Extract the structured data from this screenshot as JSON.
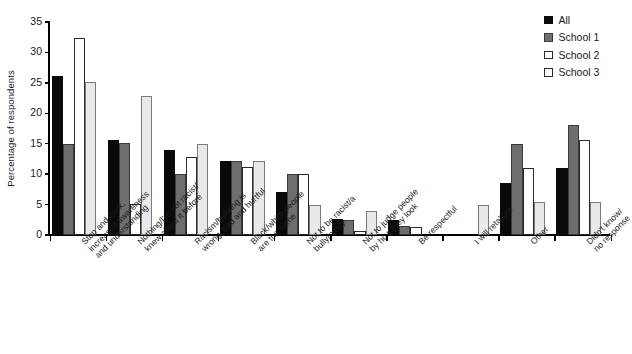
{
  "chart_data": {
    "type": "bar",
    "title": "",
    "xlabel": "",
    "ylabel": "Percentage of respondents",
    "ylim": [
      0,
      35
    ],
    "ytick_step": 5,
    "yticks": [
      0,
      5,
      10,
      15,
      20,
      25,
      30,
      35
    ],
    "grid": false,
    "legend_position": "top-right",
    "categories": [
      "Stop and think,\nincreased awareness\nand understanding",
      "Nothing/I'm not racist/\nknew about it before",
      "Racism/bullying is\nwrong, bad and hurtful",
      "Black/white people\nare the same",
      "Not to be racist/a\nbully/nasty",
      "Not to judge people\nby how they look",
      "Be respectful",
      "I will retaliate",
      "Other",
      "Didn't know/\nno response"
    ],
    "series": [
      {
        "name": "All",
        "color": "#0a0a0a",
        "values": [
          26.2,
          15.6,
          13.9,
          12.2,
          7.0,
          2.6,
          2.5,
          0.0,
          8.6,
          11.0
        ]
      },
      {
        "name": "School 1",
        "color": "#6e6e6e",
        "values": [
          15.0,
          15.1,
          10.1,
          12.2,
          10.0,
          2.5,
          1.4,
          0.0,
          14.9,
          18.0
        ]
      },
      {
        "name": "School 2",
        "color": "#ffffff",
        "values": [
          32.3,
          5.1,
          12.8,
          11.1,
          10.0,
          0.6,
          1.3,
          0.0,
          11.0,
          15.6
        ]
      },
      {
        "name": "School 3",
        "color": "#e9e9e9",
        "values": [
          25.1,
          22.8,
          15.0,
          12.2,
          5.0,
          4.0,
          0.0,
          5.0,
          5.5,
          5.5
        ]
      }
    ]
  },
  "legend": {
    "entries": [
      {
        "label": "All",
        "swatch": "all"
      },
      {
        "label": "School 1",
        "swatch": "s1"
      },
      {
        "label": "School 2",
        "swatch": "s2"
      },
      {
        "label": "School 3",
        "swatch": "s3"
      }
    ]
  },
  "axis": {
    "y_title": "Percentage of respondents"
  }
}
